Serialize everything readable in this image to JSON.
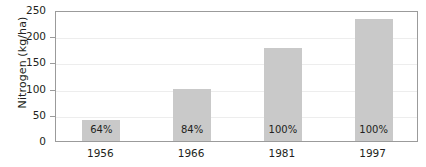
{
  "chart_data": {
    "type": "bar",
    "title": "",
    "xlabel": "",
    "ylabel": "Nitrogen (kg/ha)",
    "categories": [
      "1956",
      "1966",
      "1981",
      "1997"
    ],
    "values": [
      41,
      100,
      178,
      233
    ],
    "point_labels": [
      "64%",
      "84%",
      "100%",
      "100%"
    ],
    "ylim": [
      0,
      250
    ],
    "yticks": [
      "0",
      "50",
      "100",
      "150",
      "200",
      "250"
    ],
    "ytick_values": [
      0,
      50,
      100,
      150,
      200,
      250
    ],
    "grid": "horizontal",
    "legend": "none",
    "bar_color": "#c9c9c9",
    "axis_color": "#9b9b9b",
    "text_color": "#231f20",
    "background": "#ffffff"
  }
}
